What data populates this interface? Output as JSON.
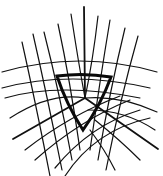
{
  "diagram": {
    "stroke_color": "#111111",
    "background": "#ffffff",
    "center": [
      85,
      98
    ],
    "triangle": {
      "vertices": [
        [
          57,
          76
        ],
        [
          111,
          77
        ],
        [
          83,
          130
        ]
      ],
      "bulge": 4
    },
    "axes": [
      [
        [
          85,
          98
        ],
        [
          84,
          7
        ]
      ],
      [
        [
          85,
          98
        ],
        [
          13,
          139
        ]
      ],
      [
        [
          85,
          98
        ],
        [
          158,
          149
        ]
      ]
    ],
    "curves": [
      "M2,72 Q80,50 157,72",
      "M2,88 Q70,70 150,88",
      "M5,98 Q60,82 140,98",
      "M10,118 Q50,92 85,98",
      "M22,42 Q35,100 50,176",
      "M33,34 Q48,100 62,170",
      "M44,32 Q60,95 72,160",
      "M58,24 Q70,80 80,150",
      "M71,14 Q78,60 85,98",
      "M98,16 Q93,60 85,98",
      "M110,20 Q100,80 90,150",
      "M125,28 Q110,90 98,160",
      "M138,36 Q120,100 106,170",
      "M25,150 Q70,115 120,96",
      "M35,160 Q80,120 130,100",
      "M55,168 Q90,125 140,110",
      "M65,176 Q95,130 150,118",
      "M85,98 Q120,95 157,112",
      "M88,110 Q125,110 155,130",
      "M95,120 Q120,140 140,160",
      "M90,130 Q105,150 115,170"
    ]
  }
}
